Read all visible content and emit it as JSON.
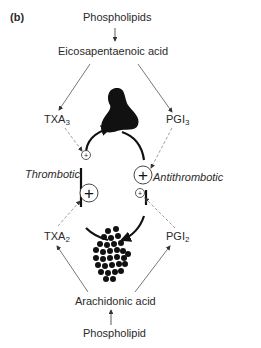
{
  "panel_label": "(b)",
  "top": {
    "source": "Phospholipids",
    "acid": "Eicosapentaenoic acid",
    "left_product": {
      "base": "TXA",
      "sub": "3"
    },
    "right_product": {
      "base": "PGI",
      "sub": "3"
    }
  },
  "bottom": {
    "source": "Phospholipid",
    "acid": "Arachidonic acid",
    "left_product": {
      "base": "TXA",
      "sub": "2"
    },
    "right_product": {
      "base": "PGI",
      "sub": "2"
    }
  },
  "cycle": {
    "left_label": "Thrombotic",
    "right_label": "Antithrombotic",
    "top_shape": "activated-platelet",
    "bottom_shape": "platelet-aggregate",
    "small_plus": "+",
    "large_plus": "+"
  }
}
